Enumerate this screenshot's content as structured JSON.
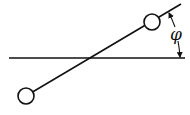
{
  "diagram": {
    "type": "rod-with-two-masses-angle",
    "angle_label": "φ",
    "stroke_color": "#111111",
    "background": "#ffffff",
    "horizontal_line": {
      "x1": 9,
      "y1": 58,
      "x2": 185,
      "y2": 58
    },
    "rod": {
      "x1": 26,
      "y1": 96,
      "x2": 181,
      "y2": 4
    },
    "masses": [
      {
        "name": "lower-left-mass",
        "cx": 26,
        "cy": 96,
        "r": 8
      },
      {
        "name": "upper-right-mass",
        "cx": 152,
        "cy": 22,
        "r": 8
      }
    ],
    "angle_arc": {
      "from_x": 169,
      "from_y": 13,
      "to_x": 180,
      "to_y": 57
    }
  }
}
